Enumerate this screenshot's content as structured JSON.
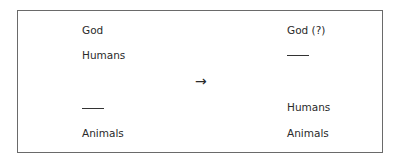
{
  "diagram": {
    "left_column": {
      "items": [
        "God",
        "Humans",
        "Animals"
      ],
      "blank_position": "between Humans and Animals"
    },
    "arrow": "→",
    "right_column": {
      "items": [
        "God (?)",
        "Humans",
        "Animals"
      ],
      "blank_position": "between God (?) and Humans"
    }
  }
}
